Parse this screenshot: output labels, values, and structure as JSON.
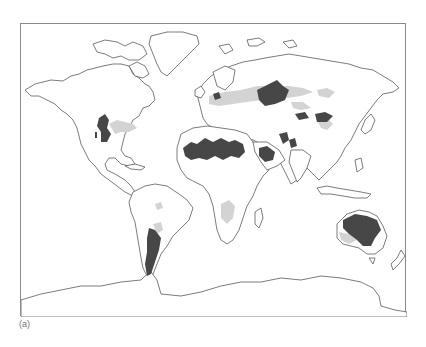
{
  "figure": {
    "label": "(a)",
    "type": "world map",
    "legend_colors": {
      "dark_region": "#474747",
      "light_region": "#d3d3d3",
      "coastline": "#5a5a5a",
      "frame": "#8a8a8a",
      "background": "#ffffff"
    }
  },
  "map": {
    "dark_regions": [
      "Western North America (Great Basin / Southwest)",
      "Southern South America (Patagonia / Monte)",
      "North Africa (Sahara)",
      "Arabian Peninsula",
      "Central Asia (Kazakh / Turkestan)",
      "Iran / Afghanistan / Thar",
      "Gobi / Taklamakan",
      "Interior Australia"
    ],
    "light_regions": [
      "North American Great Plains",
      "Eastern European / Ukrainian steppe",
      "Central Eurasian steppe belt",
      "Mongolian / Manchurian steppe",
      "Southern Africa (Kalahari margin)",
      "South America (Gran Chaco / Pampas margins)",
      "Southwest Australia margin"
    ]
  }
}
